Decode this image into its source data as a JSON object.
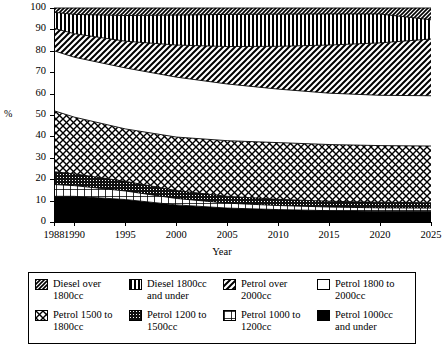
{
  "chart_data": {
    "type": "area",
    "title": "",
    "subtitle": "",
    "xlabel": "Year",
    "ylabel": "%",
    "xlim": [
      1988,
      2025
    ],
    "ylim": [
      0,
      100
    ],
    "grid": false,
    "stacked": true,
    "normalized_to_100": true,
    "legend_position": "bottom",
    "x": [
      1988,
      1990,
      1995,
      2000,
      2005,
      2010,
      2015,
      2020,
      2025
    ],
    "x_tick_labels": [
      "1988",
      "1990",
      "1995",
      "2000",
      "2005",
      "2010",
      "2015",
      "2020",
      "2025"
    ],
    "y_tick_labels": [
      "0",
      "10",
      "20",
      "30",
      "40",
      "50",
      "60",
      "70",
      "80",
      "90",
      "100"
    ],
    "y_ticks": [
      0,
      10,
      20,
      30,
      40,
      50,
      60,
      70,
      80,
      90,
      100
    ],
    "series_order_bottom_to_top": [
      "Petrol 1000cc and under",
      "Petrol 1000 to 1200cc",
      "Petrol 1200 to 1500cc",
      "Petrol 1500 to 1800cc",
      "Petrol 1800 to 2000cc",
      "Petrol over 2000cc",
      "Diesel 1800cc and under",
      "Diesel over 1800cc"
    ],
    "series": [
      {
        "name": "Petrol 1000cc and under",
        "pattern": "solid-black",
        "values": [
          12.0,
          12.0,
          10.5,
          8.0,
          6.5,
          5.8,
          5.3,
          5.0,
          5.0
        ]
      },
      {
        "name": "Petrol 1000 to 1200cc",
        "pattern": "grid",
        "values": [
          5.5,
          5.0,
          4.0,
          3.0,
          2.3,
          1.9,
          1.7,
          1.6,
          1.5
        ]
      },
      {
        "name": "Petrol 1200 to 1500cc",
        "pattern": "dense-dots",
        "values": [
          6.0,
          5.5,
          4.5,
          3.7,
          3.2,
          2.9,
          2.7,
          2.6,
          2.5
        ]
      },
      {
        "name": "Petrol 1500 to 1800cc",
        "pattern": "diagonal-crosshatch",
        "values": [
          28.5,
          26.5,
          24.5,
          25.0,
          26.0,
          26.5,
          26.5,
          26.5,
          26.5
        ]
      },
      {
        "name": "Petrol 1800 to 2000cc",
        "pattern": "white",
        "values": [
          28.0,
          28.0,
          28.5,
          28.0,
          26.5,
          25.0,
          24.0,
          23.5,
          23.5
        ]
      },
      {
        "name": "Petrol over 2000cc",
        "pattern": "diagonal-stripe",
        "values": [
          10.5,
          11.0,
          12.5,
          15.0,
          17.5,
          20.0,
          22.5,
          24.5,
          26.5
        ]
      },
      {
        "name": "Diesel 1800cc and under",
        "pattern": "vertical-stripe",
        "values": [
          7.5,
          9.0,
          12.0,
          14.0,
          15.0,
          15.0,
          14.5,
          13.5,
          9.0
        ]
      },
      {
        "name": "Diesel over 1800cc",
        "pattern": "dense-hatch",
        "values": [
          2.0,
          3.0,
          3.5,
          3.3,
          3.0,
          2.9,
          2.8,
          2.8,
          5.5
        ]
      }
    ],
    "cumulative_boundaries_percent": {
      "description": "Upper edge of each band, bottom-up, at each x tick",
      "petrol_1000_under": [
        12.0,
        12.0,
        10.5,
        8.0,
        6.5,
        5.8,
        5.3,
        5.0,
        5.0
      ],
      "petrol_1000_1200": [
        17.5,
        17.0,
        14.5,
        11.0,
        8.8,
        7.7,
        7.0,
        6.6,
        6.5
      ],
      "petrol_1200_1500": [
        23.5,
        22.5,
        19.0,
        14.7,
        12.0,
        10.6,
        9.7,
        9.2,
        9.0
      ],
      "petrol_1500_1800": [
        52.0,
        49.0,
        43.5,
        39.7,
        38.0,
        37.1,
        36.2,
        35.7,
        35.5
      ],
      "petrol_1800_2000": [
        80.0,
        77.0,
        72.0,
        67.7,
        64.5,
        62.1,
        60.2,
        59.2,
        59.0
      ],
      "petrol_over_2000": [
        90.5,
        88.0,
        84.5,
        82.7,
        82.0,
        82.1,
        82.7,
        83.7,
        85.5
      ],
      "diesel_1800_under": [
        98.0,
        97.0,
        96.5,
        96.7,
        97.0,
        97.1,
        97.2,
        97.2,
        94.5
      ],
      "diesel_over_1800": [
        100,
        100,
        100,
        100,
        100,
        100,
        100,
        100,
        100
      ]
    }
  },
  "axes": {
    "y_title": "%",
    "x_title": "Year",
    "y_ticks": [
      "100",
      "90",
      "80",
      "70",
      "60",
      "50",
      "40",
      "30",
      "20",
      "10",
      "0"
    ],
    "x_ticks": [
      "1988",
      "1990",
      "1995",
      "2000",
      "2005",
      "2010",
      "2015",
      "2020",
      "2025"
    ]
  },
  "legend": {
    "items": [
      {
        "label_line1": "Diesel over",
        "label_line2": "1800cc",
        "pattern": "dense-hatch",
        "swatch_name": "swatch-diesel-over-1800cc"
      },
      {
        "label_line1": "Diesel 1800cc",
        "label_line2": "and under",
        "pattern": "vertical-stripe",
        "swatch_name": "swatch-diesel-1800cc-and-under"
      },
      {
        "label_line1": "Petrol over",
        "label_line2": "2000cc",
        "pattern": "diagonal-stripe",
        "swatch_name": "swatch-petrol-over-2000cc"
      },
      {
        "label_line1": "Petrol 1800 to",
        "label_line2": "2000cc",
        "pattern": "white",
        "swatch_name": "swatch-petrol-1800-to-2000cc"
      },
      {
        "label_line1": "Petrol 1500 to",
        "label_line2": "1800cc",
        "pattern": "diagonal-crosshatch",
        "swatch_name": "swatch-petrol-1500-to-1800cc"
      },
      {
        "label_line1": "Petrol 1200 to",
        "label_line2": "1500cc",
        "pattern": "dense-dots",
        "swatch_name": "swatch-petrol-1200-to-1500cc"
      },
      {
        "label_line1": "Petrol 1000 to",
        "label_line2": "1200cc",
        "pattern": "grid",
        "swatch_name": "swatch-petrol-1000-to-1200cc"
      },
      {
        "label_line1": "Petrol 1000cc",
        "label_line2": "and under",
        "pattern": "solid-black",
        "swatch_name": "swatch-petrol-1000cc-and-under"
      }
    ]
  },
  "colors": {
    "foreground": "#000000",
    "background": "#ffffff",
    "band_fill_light": "#ffffff",
    "band_fill_dark": "#1a1a1a"
  }
}
